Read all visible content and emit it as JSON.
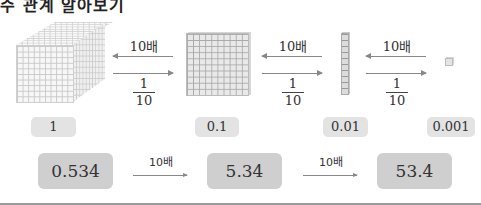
{
  "heading": "수 관계 알아보기",
  "blocks": [
    {
      "name": "thousand-cube",
      "value_label": "1"
    },
    {
      "name": "hundred-flat",
      "value_label": "0.1"
    },
    {
      "name": "ten-rod",
      "value_label": "0.01"
    },
    {
      "name": "unit-cube",
      "value_label": "0.001"
    }
  ],
  "arrows": [
    {
      "times_label": "10배",
      "fraction": {
        "numerator": "1",
        "denominator": "10"
      }
    },
    {
      "times_label": "10배",
      "fraction": {
        "numerator": "1",
        "denominator": "10"
      }
    },
    {
      "times_label": "10배",
      "fraction": {
        "numerator": "1",
        "denominator": "10"
      }
    }
  ],
  "example_row": {
    "values": [
      "0.534",
      "5.34",
      "53.4"
    ],
    "arrows": [
      {
        "label": "10배"
      },
      {
        "label": "10배"
      }
    ]
  },
  "colors": {
    "tag_bg": "#e3e3e3",
    "box_bg": "#cfcfcf",
    "arrow": "#888888"
  }
}
